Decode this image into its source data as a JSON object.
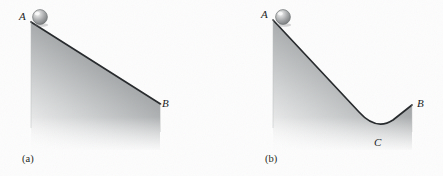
{
  "figure": {
    "background_color": "#fdfdfd",
    "line_color": "#25282b",
    "fill_dark": "#8e9193",
    "fill_light": "#fbfbfb"
  },
  "panels": [
    {
      "id": "a",
      "caption": "(a)",
      "description": "Straight inclined plane descending from A to B",
      "labels": [
        {
          "name": "A",
          "text": "A",
          "x": 19,
          "y": 11
        },
        {
          "name": "B",
          "text": "B",
          "x": 162,
          "y": 98
        }
      ],
      "ball": {
        "cx": 40,
        "cy": 17,
        "r": 7.5,
        "color": "#9a9c9e",
        "highlight": "#efefef"
      },
      "path_points": [
        {
          "label": "A",
          "x": 31,
          "y": 22
        },
        {
          "label": "B",
          "x": 160,
          "y": 104
        }
      ]
    },
    {
      "id": "b",
      "caption": "(b)",
      "description": "Valley-shaped surface descending from A to C then rising to B",
      "labels": [
        {
          "name": "A",
          "text": "A",
          "x": 40,
          "y": 9
        },
        {
          "name": "C",
          "text": "C",
          "x": 153,
          "y": 137
        },
        {
          "name": "B",
          "text": "B",
          "x": 196,
          "y": 98
        }
      ],
      "ball": {
        "cx": 62,
        "cy": 17,
        "r": 7.5,
        "color": "#9a9c9e",
        "highlight": "#efefef"
      },
      "path_points": [
        {
          "label": "A",
          "x": 52,
          "y": 20
        },
        {
          "label": "C",
          "x": 155,
          "y": 130
        },
        {
          "label": "B",
          "x": 191,
          "y": 105
        }
      ]
    }
  ]
}
